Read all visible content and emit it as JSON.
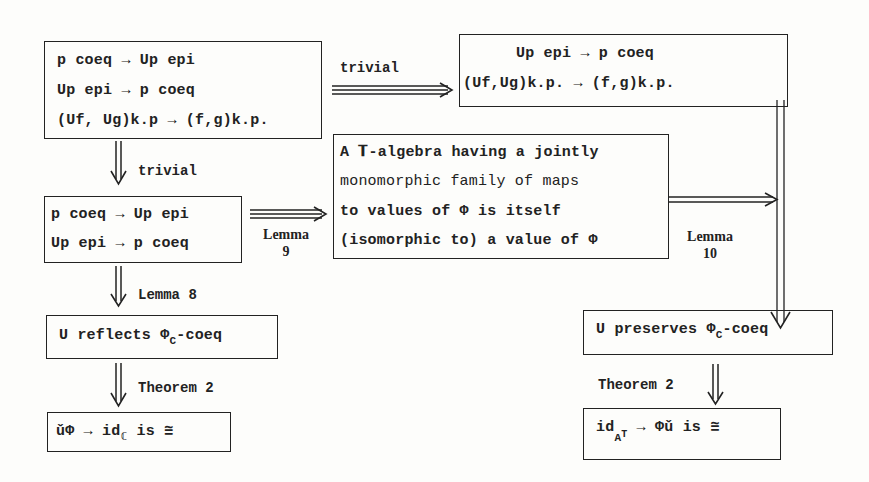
{
  "diagram": {
    "box_top_left": {
      "lines": [
        "p coeq → Up epi",
        "Up epi → p coeq",
        "(Uf, Ug)k.p → (f,g)k.p."
      ]
    },
    "box_top_right": {
      "lines": [
        "Up epi → p coeq",
        "(Uf,Ug)k.p. → (f,g)k.p."
      ]
    },
    "box_mid_left": {
      "lines": [
        "p coeq → Up epi",
        "Up epi → p coeq"
      ]
    },
    "box_center": {
      "lines": [
        "A 𝐓-algebra having a jointly",
        "monomorphic family of maps",
        "to values of  Φ  is itself",
        "(isomorphic to) a value of Φ"
      ]
    },
    "box_reflects": {
      "prefix": "U reflects Φ",
      "subscript": "C",
      "suffix": "-coeq"
    },
    "box_preserves": {
      "prefix": "U preserves Φ",
      "subscript": "C",
      "suffix": "-coeq"
    },
    "box_bottom_left": {
      "prefix": "ǔΦ → id",
      "subscript": "ℂ",
      "suffix": " is ≅"
    },
    "box_bottom_right": {
      "prefix": "id",
      "subscript": "A",
      "superscript": "T",
      "suffix": " → Φǔ is ≅"
    },
    "arrows": {
      "top_horizontal_label": "trivial",
      "left_down_1_label": "trivial",
      "mid_horizontal_label_1": "Lemma",
      "mid_horizontal_label_2": "9",
      "right_horizontal_label_1": "Lemma",
      "right_horizontal_label_2": "10",
      "left_down_2_label": "Lemma 8",
      "left_down_3_label": "Theorem 2",
      "right_down_label": "Theorem 2"
    }
  }
}
